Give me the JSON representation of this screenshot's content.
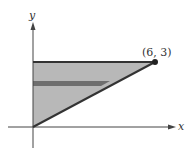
{
  "diagram": {
    "axes": {
      "x_label": "x",
      "y_label": "y"
    },
    "point": {
      "label": "(6, 3)",
      "x": 6,
      "y": 3
    },
    "region": "triangle bounded by y-axis, y = 3, and line y = x/2",
    "strip": "horizontal representative rectangle",
    "colors": {
      "fill": "#b4b4b4",
      "strip": "#6e6e6e",
      "line": "#333333"
    }
  }
}
